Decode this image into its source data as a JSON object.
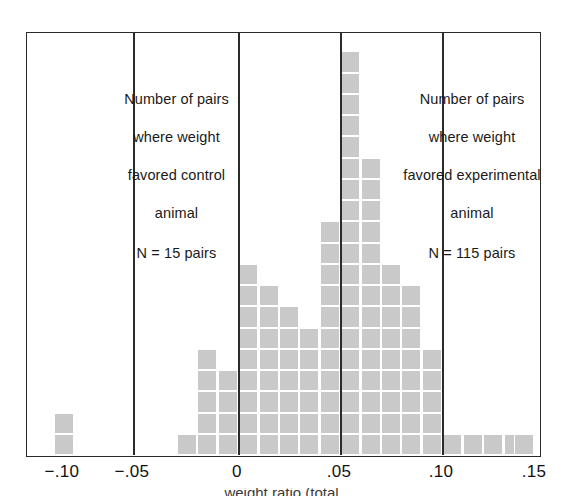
{
  "figure": {
    "title": "",
    "frame": {
      "left": 26,
      "top": 32,
      "width": 515,
      "height": 425
    }
  },
  "annotations": {
    "left": {
      "line1": "Number of pairs",
      "line2": "where weight",
      "line3": "favored control",
      "line4": "animal",
      "line5": "N = 15 pairs"
    },
    "right": {
      "line1": "Number of pairs",
      "line2": "where weight",
      "line3": "favored experimental",
      "line4": "animal",
      "line5": "N = 115 pairs"
    }
  },
  "axis": {
    "ticks": [
      {
        "label": "−.10",
        "value": -0.1,
        "x": 62
      },
      {
        "label": "−.05",
        "value": -0.05,
        "x": 132
      },
      {
        "label": "0",
        "value": 0.0,
        "x": 237
      },
      {
        "label": ".05",
        "value": 0.05,
        "x": 339
      },
      {
        "label": ".10",
        "value": 0.1,
        "x": 441
      },
      {
        "label": ".15",
        "value": 0.15,
        "x": 534
      }
    ],
    "caption_partial": "weight ratio (total"
  },
  "reference_lines": [
    {
      "name": "control-boundary",
      "value": -0.05,
      "x": 132
    },
    {
      "name": "zero-line",
      "value": 0.0,
      "x": 237
    },
    {
      "name": "mean-line",
      "value": 0.05,
      "x": 339
    },
    {
      "name": "upper-line",
      "value": 0.1,
      "x": 441
    }
  ],
  "style": {
    "bar_fill": "#c9c9c9",
    "bar_gap": "#ffffff",
    "frame_color": "#2b2b2b",
    "background": "#ffffff",
    "cell_width": 20.4,
    "cell_height": 21.25
  },
  "chart_data": {
    "type": "bar",
    "title": "",
    "subtitle": "",
    "xlabel": "weight ratio (total)",
    "ylabel": "Number of pairs",
    "xlim": [
      -0.115,
      0.155
    ],
    "ylim": [
      0,
      20
    ],
    "grid": false,
    "legend": "none",
    "note": "Stacked unit-square histogram; each square = 1 pair. Bin width = 0.01. Values are counts per bin; bin centers given in x_centers.",
    "x_centers": [
      -0.095,
      -0.085,
      -0.075,
      -0.065,
      -0.055,
      -0.045,
      -0.035,
      -0.025,
      -0.015,
      -0.005,
      0.005,
      0.015,
      0.025,
      0.035,
      0.045,
      0.055,
      0.065,
      0.075,
      0.085,
      0.095,
      0.105,
      0.115,
      0.125,
      0.135,
      0.145
    ],
    "categories": [
      "-.095",
      "-.085",
      "-.075",
      "-.065",
      "-.055",
      "-.045",
      "-.035",
      "-.025",
      "-.015",
      "-.005",
      ".005",
      ".015",
      ".025",
      ".035",
      ".045",
      ".055",
      ".065",
      ".075",
      ".085",
      ".095",
      ".105",
      ".115",
      ".125",
      ".135",
      ".145"
    ],
    "values": [
      2,
      0,
      0,
      0,
      0,
      0,
      1,
      5,
      4,
      9,
      8,
      7,
      6,
      11,
      19,
      14,
      9,
      8,
      5,
      1,
      1,
      1,
      1,
      0,
      1
    ],
    "totals": {
      "favored_control": 15,
      "favored_experimental": 115
    }
  },
  "bars": [
    {
      "x_index": 0,
      "left": 27,
      "count": 2
    },
    {
      "x_index": 6,
      "left": 150,
      "count": 1
    },
    {
      "x_index": 7,
      "left": 170,
      "count": 5
    },
    {
      "x_index": 8,
      "left": 191,
      "count": 4
    },
    {
      "x_index": 9,
      "left": 211,
      "count": 9
    },
    {
      "x_index": 10,
      "left": 232,
      "count": 8
    },
    {
      "x_index": 11,
      "left": 252,
      "count": 7
    },
    {
      "x_index": 12,
      "left": 272,
      "count": 6
    },
    {
      "x_index": 13,
      "left": 293,
      "count": 11
    },
    {
      "x_index": 14,
      "left": 313,
      "count": 19
    },
    {
      "x_index": 15,
      "left": 334,
      "count": 14
    },
    {
      "x_index": 16,
      "left": 354,
      "count": 9
    },
    {
      "x_index": 17,
      "left": 374,
      "count": 8
    },
    {
      "x_index": 18,
      "left": 395,
      "count": 5
    },
    {
      "x_index": 19,
      "left": 415,
      "count": 1
    },
    {
      "x_index": 20,
      "left": 436,
      "count": 1
    },
    {
      "x_index": 21,
      "left": 456,
      "count": 1
    },
    {
      "x_index": 22,
      "left": 477,
      "count": 1
    },
    {
      "x_index": 24,
      "left": 487,
      "count": 1
    }
  ]
}
